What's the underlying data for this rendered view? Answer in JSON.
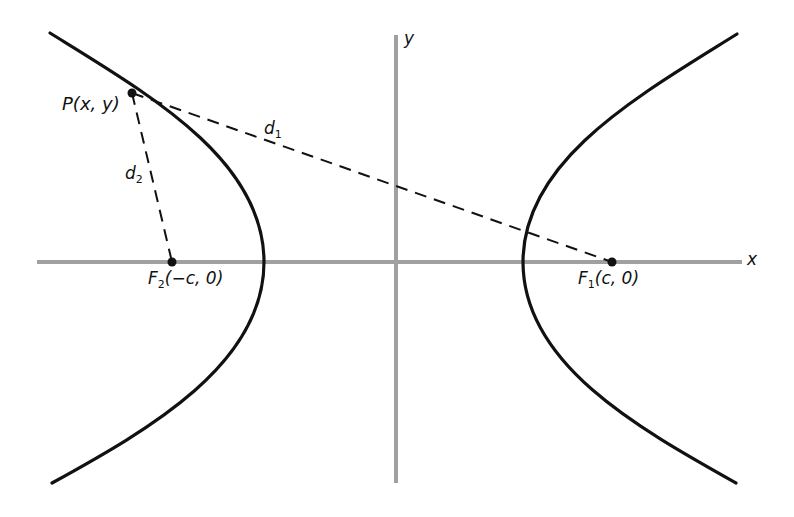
{
  "diagram": {
    "axes": {
      "x_label": "x",
      "y_label": "y",
      "axis_color": "#9a9a9a"
    },
    "curve_color": "#111111",
    "labels": {
      "point_p": "P(x, y)",
      "d1": "d",
      "d1_sub": "1",
      "d2": "d",
      "d2_sub": "2",
      "f1_letter": "F",
      "f1_sub": "1",
      "f1_coords": "(c, 0)",
      "f2_letter": "F",
      "f2_sub": "2",
      "f2_coords": "(−c, 0)"
    },
    "points": {
      "P": {
        "x": 132,
        "y": 93
      },
      "F1": {
        "x": 612,
        "y": 262
      },
      "F2": {
        "x": 172,
        "y": 262
      }
    },
    "relation": "|d1 − d2| = constant"
  }
}
